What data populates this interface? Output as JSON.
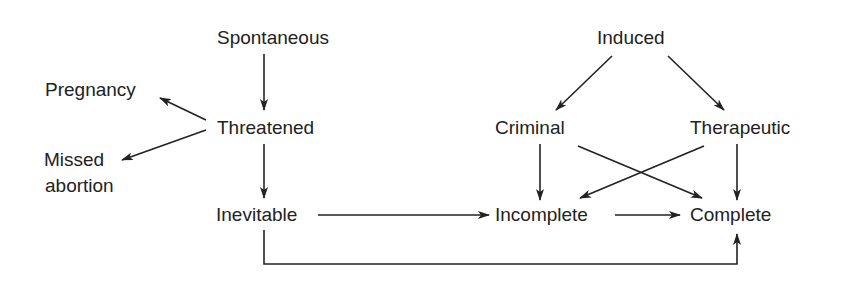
{
  "diagram": {
    "nodes": {
      "spontaneous": "Spontaneous",
      "threatened": "Threatened",
      "pregnancy": "Pregnancy",
      "missed_line1": "Missed",
      "missed_line2": "abortion",
      "inevitable": "Inevitable",
      "induced": "Induced",
      "criminal": "Criminal",
      "therapeutic": "Therapeutic",
      "incomplete": "Incomplete",
      "complete": "Complete"
    },
    "edges": [
      {
        "from": "Spontaneous",
        "to": "Threatened"
      },
      {
        "from": "Threatened",
        "to": "Pregnancy"
      },
      {
        "from": "Threatened",
        "to": "Missed abortion"
      },
      {
        "from": "Threatened",
        "to": "Inevitable"
      },
      {
        "from": "Inevitable",
        "to": "Incomplete"
      },
      {
        "from": "Inevitable",
        "to": "Complete"
      },
      {
        "from": "Induced",
        "to": "Criminal"
      },
      {
        "from": "Induced",
        "to": "Therapeutic"
      },
      {
        "from": "Criminal",
        "to": "Incomplete"
      },
      {
        "from": "Criminal",
        "to": "Complete"
      },
      {
        "from": "Therapeutic",
        "to": "Incomplete"
      },
      {
        "from": "Therapeutic",
        "to": "Complete"
      },
      {
        "from": "Incomplete",
        "to": "Complete"
      }
    ]
  }
}
